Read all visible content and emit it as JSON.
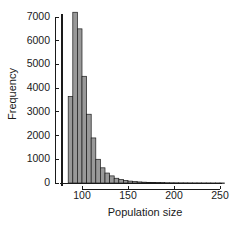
{
  "chart_data": {
    "type": "bar",
    "title": "",
    "subtitle": "",
    "xlabel": "Population size",
    "ylabel": "Frequency",
    "xlim": [
      83,
      252
    ],
    "ylim": [
      0,
      7400
    ],
    "grid": false,
    "legend": null,
    "bin_width": 5,
    "xticks": [
      100,
      150,
      200,
      250
    ],
    "yticks": [
      0,
      1000,
      2000,
      3000,
      4000,
      5000,
      6000,
      7000
    ],
    "xtick_labels": [
      "100",
      "150",
      "200",
      "250"
    ],
    "ytick_labels": [
      "0",
      "1000",
      "2000",
      "3000",
      "4000",
      "5000",
      "6000",
      "7000"
    ],
    "bar_fill": "#999999",
    "bar_edge": "#1a1a1a",
    "axis_color": "#1a1a1a",
    "categories": [
      "85",
      "90",
      "95",
      "100",
      "105",
      "110",
      "115",
      "120",
      "125",
      "130",
      "135",
      "140",
      "145",
      "150",
      "155",
      "160",
      "165",
      "170",
      "175",
      "180",
      "185",
      "190",
      "195",
      "200",
      "205",
      "210",
      "215",
      "220",
      "225",
      "230",
      "235",
      "240",
      "245",
      "250"
    ],
    "values": [
      3650,
      7200,
      6500,
      4500,
      2900,
      1900,
      1000,
      640,
      420,
      300,
      200,
      150,
      110,
      80,
      60,
      45,
      35,
      28,
      22,
      18,
      15,
      12,
      10,
      9,
      8,
      7,
      6,
      5,
      5,
      4,
      4,
      3,
      3,
      2
    ],
    "bin_starts": [
      85,
      90,
      95,
      100,
      105,
      110,
      115,
      120,
      125,
      130,
      135,
      140,
      145,
      150,
      155,
      160,
      165,
      170,
      175,
      180,
      185,
      190,
      195,
      200,
      205,
      210,
      215,
      220,
      225,
      230,
      235,
      240,
      245,
      250
    ]
  }
}
